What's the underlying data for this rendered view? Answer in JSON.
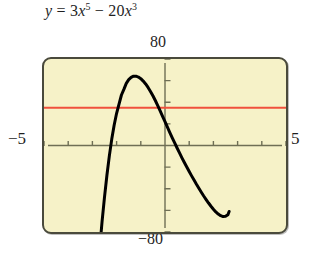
{
  "caption": {
    "equation_plain": "y = 3x^5 - 20x^3",
    "lhs": "y",
    "equals": "=",
    "term1_coef": "3",
    "term1_var": "x",
    "term1_exp": "5",
    "minus": "−",
    "term2_coef": "20",
    "term2_var": "x",
    "term2_exp": "3"
  },
  "labels": {
    "ymax": "80",
    "ymin": "−80",
    "xmin": "−5",
    "xmax": "5"
  },
  "colors": {
    "screen_background": "#f6f2c8",
    "screen_border": "#4a4a3c",
    "axis": "#6f6f55",
    "curve": "#000000",
    "reference_line": "#f0513c",
    "text": "#1f1f1f"
  },
  "chart_data": {
    "type": "line",
    "xlabel": "x",
    "ylabel": "y",
    "xlim": [
      -5,
      5
    ],
    "ylim": [
      -80,
      80
    ],
    "grid": false,
    "legend": "none",
    "x_tick_step": 1,
    "y_tick_step": 20,
    "x_ticks": [
      -5,
      -4,
      -3,
      -2,
      -1,
      0,
      1,
      2,
      3,
      4,
      5
    ],
    "y_ticks": [
      -80,
      -60,
      -40,
      -20,
      0,
      20,
      40,
      60,
      80
    ],
    "tick_labels_shown": false,
    "window_corner_labels": {
      "top": "80",
      "bottom": "−80",
      "left": "−5",
      "right": "5"
    },
    "series": [
      {
        "name": "y = 3x^5 - 20x^3",
        "color": "#000000",
        "width": 3,
        "x": [
          -2.65,
          -2.6,
          -2.5,
          -2.4,
          -2.3,
          -2.2,
          -2.1,
          -2.0,
          -1.9,
          -1.8,
          -1.7,
          -1.6,
          -1.5,
          -1.4,
          -1.3,
          -1.2,
          -1.1,
          -1.0,
          -0.9,
          -0.8,
          -0.7,
          -0.6,
          -0.5,
          -0.4,
          -0.3,
          -0.2,
          -0.1,
          0.0,
          0.1,
          0.2,
          0.3,
          0.4,
          0.5,
          0.6,
          0.7,
          0.8,
          0.9,
          1.0,
          1.1,
          1.2,
          1.3,
          1.4,
          1.5,
          1.6,
          1.7,
          1.8,
          1.9,
          2.0,
          2.1,
          2.2,
          2.3,
          2.4,
          2.5,
          2.6,
          2.65
        ],
        "y": [
          -83.1,
          -70.2,
          -47.7,
          -27.5,
          -9.6,
          5.9,
          19.0,
          29.8,
          38.3,
          46.7,
          51.9,
          57.5,
          60.9,
          63.0,
          64.1,
          64.1,
          63.3,
          61.8,
          59.6,
          56.9,
          53.7,
          50.0,
          46.0,
          41.6,
          36.9,
          32.0,
          27.0,
          22.0,
          17.0,
          12.0,
          7.1,
          2.4,
          -2.3,
          -6.9,
          -11.4,
          -15.7,
          -19.9,
          -24.1,
          -28.1,
          -32.0,
          -35.9,
          -39.6,
          -43.2,
          -46.7,
          -50.0,
          -53.2,
          -56.2,
          -58.9,
          -61.4,
          -63.4,
          -64.9,
          -65.7,
          -65.5,
          -64.0,
          -61.0
        ]
      },
      {
        "name": "reference horizontal line",
        "color": "#f0513c",
        "width": 2,
        "type": "hline",
        "y_value": 35
      }
    ],
    "notes": {
      "local_max": {
        "x": -2,
        "y": 64
      },
      "local_min": {
        "x": 2,
        "y": -64
      },
      "inflection_origin": {
        "x": 0,
        "y": 0
      }
    }
  }
}
